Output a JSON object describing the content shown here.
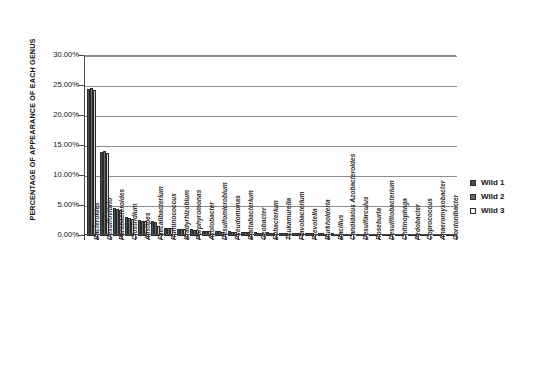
{
  "chart_data": {
    "type": "bar",
    "title": "",
    "xlabel": "",
    "ylabel": "PERCENTAGE OF APPEARANCE OF EACH GENUS",
    "ylim": [
      0,
      30
    ],
    "ytick_labels": [
      "0.00%",
      "5.00%",
      "10.00%",
      "15.00%",
      "20.00%",
      "25.00%",
      "30.00%"
    ],
    "ytick_values": [
      0,
      5,
      10,
      15,
      20,
      25,
      30
    ],
    "grid": "horizontal",
    "legend_position": "right",
    "categories": [
      "Bacteroides",
      "Desulfovibrio",
      "Parabacteroides",
      "Clostridium",
      "Alistipes",
      "Faecalibacterium",
      "Ruminococcus",
      "Bradyrhizobium",
      "Porphyromonas",
      "Azotobacter",
      "Desulfomicrobium",
      "Pseudomonas",
      "Blattabacterium",
      "Geobacter",
      "Eubacterium",
      "Tsukamurella",
      "Flavobacterium",
      "Prevotella",
      "Burkholderia",
      "Bacillus",
      "Candidatus Azobacteroides",
      "Desulfarculus",
      "Roseburia",
      "Desulfitobacterium",
      "Chitinophaga",
      "Pedobacter",
      "Coprococcus",
      "Anaeromyxobacter",
      "Gordonibacter"
    ],
    "series": [
      {
        "name": "Wild 1",
        "color": "#4d4d4d",
        "values": [
          24.5,
          14.0,
          4.6,
          3.1,
          2.6,
          2.5,
          1.4,
          1.2,
          1.1,
          0.9,
          0.8,
          0.8,
          0.7,
          0.6,
          0.6,
          0.55,
          0.5,
          0.5,
          0.45,
          0.45,
          0.4,
          0.4,
          0.35,
          0.35,
          0.3,
          0.3,
          0.3,
          0.25,
          0.25
        ]
      },
      {
        "name": "Wild 2",
        "color": "#6e6e6e",
        "values": [
          24.6,
          14.1,
          4.5,
          3.0,
          2.5,
          2.4,
          1.35,
          1.15,
          1.05,
          0.85,
          0.78,
          0.75,
          0.68,
          0.58,
          0.55,
          0.5,
          0.48,
          0.46,
          0.42,
          0.4,
          0.38,
          0.36,
          0.32,
          0.3,
          0.28,
          0.27,
          0.26,
          0.22,
          0.2
        ]
      },
      {
        "name": "Wild 3",
        "color": "#d2d2d2",
        "values": [
          24.4,
          13.9,
          4.4,
          2.9,
          2.45,
          1.6,
          1.3,
          1.1,
          1.0,
          0.8,
          0.72,
          0.7,
          0.62,
          0.55,
          0.5,
          0.46,
          0.44,
          0.42,
          0.4,
          0.36,
          0.34,
          0.32,
          0.3,
          0.28,
          0.25,
          0.24,
          0.22,
          0.2,
          0.18
        ]
      }
    ]
  },
  "legend": {
    "items": [
      {
        "label": "Wild 1"
      },
      {
        "label": "Wild 2"
      },
      {
        "label": "Wild 3"
      }
    ]
  }
}
